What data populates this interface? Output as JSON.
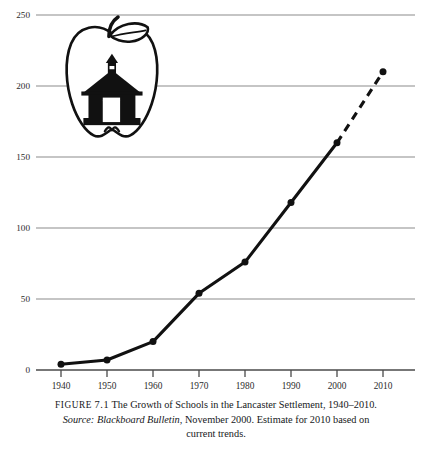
{
  "figure": {
    "label_prefix": "FIGURE",
    "number": "7.1",
    "title": "The Growth of Schools in the Lancaster Settlement, 1940–2010.",
    "source_label": "Source:",
    "source_title": "Blackboard Bulletin,",
    "source_rest": "November 2000. Estimate for 2010 based on",
    "source_tail": "current trends."
  },
  "decoration": {
    "logo_name": "apple-with-schoolhouse-logo",
    "apple_outline_color": "#111111",
    "schoolhouse_fill": "#111111"
  },
  "style": {
    "gridline_color": "#8c8c8c",
    "axis_color": "#4a4a4a",
    "series_color": "#111111",
    "tick_label_color": "#2b2b2b",
    "background": "#ffffff"
  },
  "chart_data": {
    "type": "line",
    "title": "The Growth of Schools in the Lancaster Settlement, 1940–2010",
    "xlabel": "",
    "ylabel": "",
    "x": [
      1940,
      1950,
      1960,
      1970,
      1980,
      1990,
      2000,
      2010
    ],
    "categories": [
      "1940",
      "1950",
      "1960",
      "1970",
      "1980",
      "1990",
      "2000",
      "2010"
    ],
    "values": [
      4,
      7,
      20,
      54,
      76,
      118,
      160,
      210
    ],
    "series": [
      {
        "name": "Number of schools",
        "values": [
          4,
          7,
          20,
          54,
          76,
          118,
          160,
          210
        ],
        "solid_through": 2000,
        "dashed_from": 2000,
        "dashed_note": "Estimate for 2010 based on current trends"
      }
    ],
    "ylim": [
      0,
      250
    ],
    "yticks": [
      0,
      50,
      100,
      150,
      200,
      250
    ],
    "ytick_labels": [
      "0",
      "50",
      "100",
      "150",
      "200",
      "250"
    ],
    "xlim": [
      1935,
      2015
    ],
    "xticks": [
      1940,
      1950,
      1960,
      1970,
      1980,
      1990,
      2000,
      2010
    ],
    "xtick_labels": [
      "1940",
      "1950",
      "1960",
      "1970",
      "1980",
      "1990",
      "2000",
      "2010"
    ],
    "grid": true,
    "grid_axis": "y",
    "legend": false,
    "markers": "filled-circle"
  }
}
